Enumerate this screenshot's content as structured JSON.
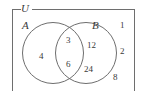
{
  "figure": {
    "type": "venn-diagram",
    "universe": {
      "label": "U"
    },
    "sets": [
      {
        "id": "A",
        "label": "A",
        "position": "left"
      },
      {
        "id": "B",
        "label": "B",
        "position": "right"
      }
    ],
    "regions": {
      "a_only": {
        "elements": [
          "4"
        ]
      },
      "intersection": {
        "elements": [
          "3",
          "6"
        ]
      },
      "b_only": {
        "elements": [
          "12",
          "24"
        ]
      },
      "outside": {
        "elements": [
          "1",
          "2",
          "8"
        ]
      }
    },
    "elements": {
      "four": "4",
      "three": "3",
      "six": "6",
      "twelve": "12",
      "twentyfour": "24",
      "one": "1",
      "two": "2",
      "eight": "8"
    },
    "colors": {
      "stroke": "#6e6e6e",
      "text": "#3a3a3a",
      "background": "#ffffff"
    }
  }
}
